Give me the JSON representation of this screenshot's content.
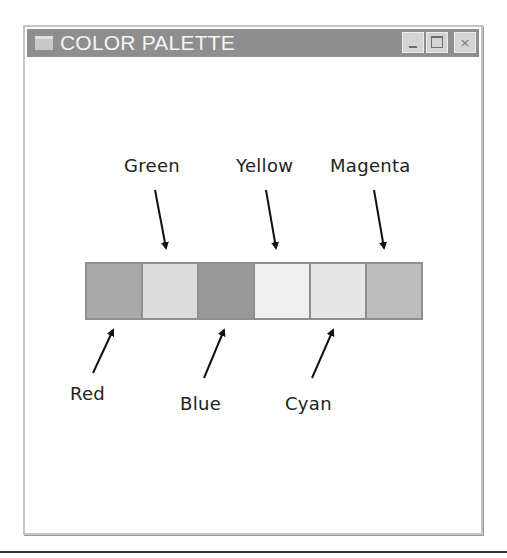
{
  "window": {
    "title": "COLOR PALETTE",
    "controls": {
      "minimize": "_",
      "maximize": "□",
      "close": "×"
    }
  },
  "palette": {
    "swatches": [
      {
        "name": "Red",
        "color": "#a9a9a9"
      },
      {
        "name": "Green",
        "color": "#dcdcdc"
      },
      {
        "name": "Blue",
        "color": "#999999"
      },
      {
        "name": "Yellow",
        "color": "#efefef"
      },
      {
        "name": "Cyan",
        "color": "#e6e6e6"
      },
      {
        "name": "Magenta",
        "color": "#bdbdbd"
      }
    ]
  },
  "labels": {
    "top": [
      "Green",
      "Yellow",
      "Magenta"
    ],
    "bottom": [
      "Red",
      "Blue",
      "Cyan"
    ]
  }
}
